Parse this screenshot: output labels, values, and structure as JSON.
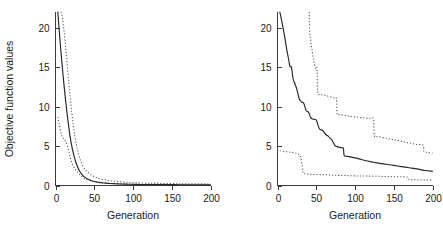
{
  "figure": {
    "background": "#ffffff",
    "solid_color": "#262626",
    "dotted_color": "#555555",
    "axis_color": "#3a3a3a"
  },
  "chart_data": [
    {
      "type": "line",
      "panel": "left",
      "title": "",
      "xlabel": "Generation",
      "ylabel": "Objective function values",
      "xlim": [
        0,
        200
      ],
      "ylim": [
        0,
        22
      ],
      "xticks": [
        0,
        50,
        100,
        150,
        200
      ],
      "xticklabels": [
        "0",
        "50",
        "100",
        "150",
        "200"
      ],
      "yticks": [
        0,
        5,
        10,
        15,
        20
      ],
      "yticklabels": [
        "0",
        "5",
        "10",
        "15",
        "20"
      ],
      "grid": false,
      "legend": "none",
      "series": [
        {
          "name": "mean",
          "style": "solid",
          "x": [
            3,
            5,
            7,
            9,
            11,
            13,
            15,
            17,
            19,
            21,
            23,
            25,
            27,
            29,
            31,
            33,
            36,
            39,
            42,
            45,
            48,
            52,
            56,
            60,
            65,
            70,
            75,
            80,
            88,
            96,
            105,
            115,
            125,
            140,
            160,
            180,
            200
          ],
          "y": [
            22.0,
            19.4,
            17.0,
            14.8,
            12.7,
            10.8,
            9.1,
            7.5,
            6.1,
            5.0,
            4.1,
            3.35,
            2.75,
            2.25,
            1.85,
            1.55,
            1.2,
            0.97,
            0.8,
            0.67,
            0.57,
            0.47,
            0.4,
            0.35,
            0.3,
            0.26,
            0.23,
            0.21,
            0.18,
            0.16,
            0.14,
            0.13,
            0.12,
            0.11,
            0.1,
            0.09,
            0.08
          ]
        },
        {
          "name": "upper-bound",
          "style": "dotted",
          "x": [
            7,
            9,
            11,
            13,
            15,
            17,
            19,
            21,
            23,
            25,
            27,
            29,
            31,
            33,
            36,
            39,
            42,
            46,
            50,
            55,
            60,
            66,
            72,
            80,
            90,
            100,
            115,
            130,
            150,
            170,
            200
          ],
          "y": [
            22.0,
            21.2,
            19.6,
            17.6,
            15.4,
            13.2,
            11.1,
            9.2,
            7.6,
            6.3,
            5.2,
            4.3,
            3.6,
            3.0,
            2.35,
            1.95,
            1.65,
            1.35,
            1.12,
            0.92,
            0.8,
            0.68,
            0.58,
            0.5,
            0.42,
            0.36,
            0.3,
            0.27,
            0.24,
            0.22,
            0.2
          ]
        },
        {
          "name": "lower-bound",
          "style": "dotted",
          "x": [
            3,
            5,
            7,
            9,
            11,
            13,
            15,
            17,
            19,
            21,
            24,
            27,
            30,
            33,
            37,
            41,
            46,
            52,
            58,
            65,
            72,
            80,
            90,
            100,
            115,
            130,
            150,
            170,
            200
          ],
          "y": [
            8.7,
            7.7,
            6.6,
            6.1,
            5.9,
            5.6,
            5.1,
            4.4,
            3.6,
            2.9,
            2.3,
            1.85,
            1.5,
            1.2,
            0.95,
            0.75,
            0.58,
            0.45,
            0.36,
            0.3,
            0.25,
            0.21,
            0.18,
            0.15,
            0.12,
            0.1,
            0.09,
            0.08,
            0.06
          ]
        }
      ]
    },
    {
      "type": "line",
      "panel": "right",
      "title": "",
      "xlabel": "Generation",
      "ylabel": "",
      "xlim": [
        0,
        200
      ],
      "ylim": [
        0,
        22
      ],
      "xticks": [
        0,
        50,
        100,
        150,
        200
      ],
      "xticklabels": [
        "0",
        "50",
        "100",
        "150",
        "200"
      ],
      "yticks": [
        0,
        5,
        10,
        15,
        20
      ],
      "yticklabels": [
        "0",
        "5",
        "10",
        "15",
        "20"
      ],
      "grid": false,
      "legend": "none",
      "series": [
        {
          "name": "mean",
          "style": "solid",
          "x": [
            3,
            6,
            9,
            12,
            14,
            16,
            18,
            20,
            22,
            25,
            28,
            31,
            34,
            37,
            40,
            43,
            46,
            50,
            54,
            58,
            62,
            66,
            70,
            74,
            78,
            82,
            85,
            86,
            90,
            95,
            100,
            108,
            116,
            124,
            132,
            140,
            150,
            160,
            170,
            180,
            190,
            200
          ],
          "y": [
            22.0,
            20.6,
            19.0,
            17.2,
            16.2,
            15.1,
            15.0,
            13.6,
            13.0,
            12.2,
            11.0,
            10.6,
            10.4,
            9.5,
            9.3,
            8.6,
            8.4,
            8.3,
            7.2,
            7.0,
            6.5,
            6.2,
            5.8,
            5.1,
            4.9,
            4.8,
            4.7,
            3.8,
            3.7,
            3.6,
            3.5,
            3.3,
            3.1,
            2.95,
            2.8,
            2.7,
            2.55,
            2.4,
            2.25,
            2.1,
            1.9,
            1.8
          ]
        },
        {
          "name": "upper-bound",
          "style": "dotted",
          "x": [
            41,
            42,
            48,
            50,
            51,
            52,
            55,
            58,
            62,
            66,
            70,
            74,
            76,
            77,
            80,
            86,
            92,
            100,
            110,
            120,
            124,
            125,
            130,
            140,
            150,
            160,
            170,
            180,
            188,
            189,
            194,
            200
          ],
          "y": [
            22.0,
            19.0,
            15.2,
            15.0,
            14.8,
            11.8,
            11.6,
            11.5,
            11.4,
            11.3,
            11.2,
            11.1,
            11.0,
            9.1,
            9.0,
            8.9,
            8.8,
            8.7,
            8.6,
            8.5,
            8.4,
            6.3,
            6.2,
            6.0,
            5.8,
            5.6,
            5.4,
            5.2,
            5.1,
            4.3,
            4.2,
            4.1
          ]
        },
        {
          "name": "lower-bound",
          "style": "dotted",
          "x": [
            3,
            10,
            18,
            24,
            28,
            30,
            32,
            33,
            34,
            40,
            48,
            56,
            64,
            72,
            80,
            90,
            100,
            112,
            124,
            136,
            148,
            160,
            168,
            170,
            180,
            190,
            200
          ],
          "y": [
            4.4,
            4.3,
            4.2,
            4.1,
            3.9,
            3.5,
            2.4,
            1.6,
            1.5,
            1.45,
            1.4,
            1.38,
            1.35,
            1.3,
            1.28,
            1.25,
            1.22,
            1.2,
            1.18,
            1.15,
            1.12,
            1.1,
            1.05,
            0.75,
            0.72,
            0.7,
            0.68
          ]
        }
      ]
    }
  ]
}
